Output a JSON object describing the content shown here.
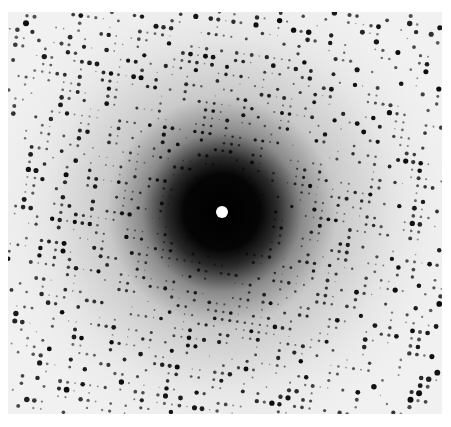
{
  "image": {
    "description": "X-ray diffraction pattern",
    "width": 451,
    "height": 427,
    "background_color": "#ffffff",
    "detector": {
      "x": 8,
      "y": 12,
      "width": 434,
      "height": 402,
      "fill_color": "#f1f1f1"
    },
    "beam_center": {
      "x": 222,
      "y": 212
    },
    "beam_stop": {
      "radius": 6,
      "color": "#ffffff"
    },
    "central_halo": {
      "stops": [
        {
          "r": 0,
          "color": "#000000"
        },
        {
          "r": 38,
          "color": "#050505"
        },
        {
          "r": 55,
          "color": "#2a2a2a"
        },
        {
          "r": 80,
          "color": "#8a8a8a"
        },
        {
          "r": 115,
          "color": "#c9c9c9"
        },
        {
          "r": 175,
          "color": "#e6e6e6"
        },
        {
          "r": 260,
          "color": "#f3f3f3"
        }
      ]
    },
    "spots": {
      "color": "#0a0a0a",
      "seed": 1337,
      "lattice_a": 7.6,
      "lattice_rotation_deg": 8,
      "min_radius": 34,
      "max_radius": 300,
      "resolution_rings": [
        62,
        95,
        128,
        160,
        195,
        232,
        270
      ],
      "ring_width": 10,
      "density": 0.62
    }
  }
}
